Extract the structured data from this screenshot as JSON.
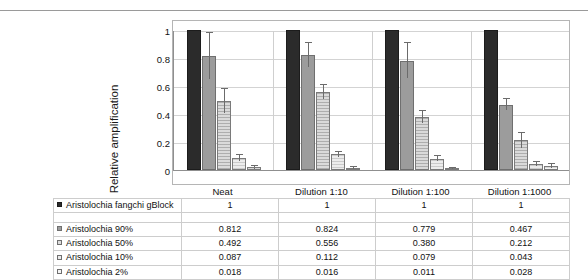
{
  "chart_data": {
    "type": "bar",
    "title": "",
    "xlabel": "",
    "ylabel": "Relative amplification",
    "ylim": [
      0,
      1
    ],
    "yticks": [
      "0",
      "0.2",
      "0.4",
      "0.6",
      "0.8",
      "1"
    ],
    "grid": true,
    "legend_position": "table-left-column",
    "categories": [
      "Neat",
      "Dilution 1:10",
      "Dilution 1:100",
      "Dilution 1:1000"
    ],
    "series": [
      {
        "name": "Aristolochia fangchi gBlock",
        "marker": "filled-black-square",
        "color": "#2b2b2b",
        "values": [
          1,
          1,
          1,
          1
        ],
        "display_values": [
          "1",
          "1",
          "1",
          "1"
        ],
        "errors": [
          0,
          0,
          0,
          0
        ]
      },
      {
        "name": "Aristolochia 90%",
        "marker": "filled-gray-square",
        "color": "#9c9c9c",
        "values": [
          0.812,
          0.824,
          0.779,
          0.467
        ],
        "display_values": [
          "0.812",
          "0.824",
          "0.779",
          "0.467"
        ],
        "errors": [
          0.165,
          0.085,
          0.125,
          0.038
        ]
      },
      {
        "name": "Aristolochia 50%",
        "marker": "open-square",
        "color": "#dadada",
        "values": [
          0.492,
          0.556,
          0.38,
          0.212
        ],
        "display_values": [
          "0.492",
          "0.556",
          "0.380",
          "0.212"
        ],
        "errors": [
          0.085,
          0.048,
          0.045,
          0.055
        ]
      },
      {
        "name": "Aristolochia 10%",
        "marker": "open-square",
        "color": "#ececec",
        "values": [
          0.087,
          0.112,
          0.079,
          0.043
        ],
        "display_values": [
          "0.087",
          "0.112",
          "0.079",
          "0.043"
        ],
        "errors": [
          0.022,
          0.02,
          0.018,
          0.015
        ]
      },
      {
        "name": "Aristolochia 2%",
        "marker": "open-square",
        "color": "#f4f4f4",
        "values": [
          0.018,
          0.016,
          0.011,
          0.028
        ],
        "display_values": [
          "0.018",
          "0.016",
          "0.011",
          "0.028"
        ],
        "errors": [
          0.008,
          0.006,
          0.005,
          0.012
        ]
      }
    ]
  },
  "table": {
    "row_labels": [
      "Aristolochia fangchi gBlock",
      "Aristolochia 90%",
      "Aristolochia 50%",
      "Aristolochia 10%",
      "Aristolochia 2%"
    ],
    "column_headers": [
      "Neat",
      "Dilution 1:10",
      "Dilution 1:100",
      "Dilution 1:1000"
    ],
    "rows": [
      [
        "1",
        "1",
        "1",
        "1"
      ],
      [
        "0.812",
        "0.824",
        "0.779",
        "0.467"
      ],
      [
        "0.492",
        "0.556",
        "0.380",
        "0.212"
      ],
      [
        "0.087",
        "0.112",
        "0.079",
        "0.043"
      ],
      [
        "0.018",
        "0.016",
        "0.011",
        "0.028"
      ]
    ]
  }
}
